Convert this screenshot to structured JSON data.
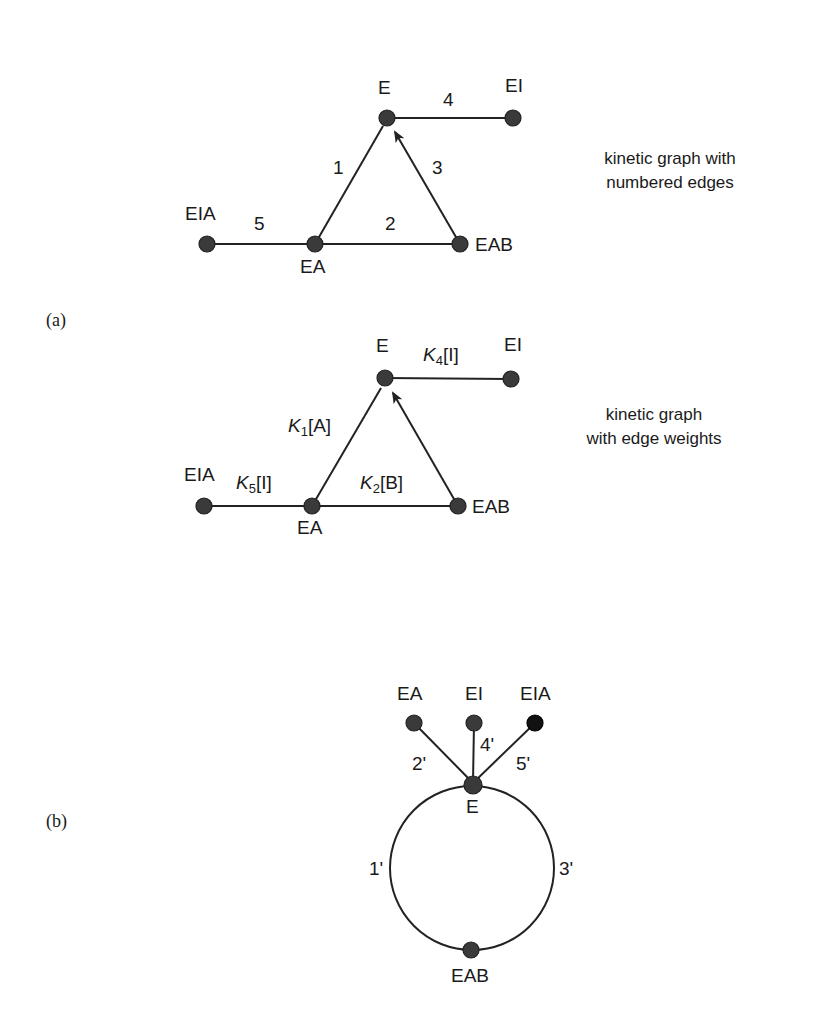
{
  "panel_a": {
    "label": "(a)",
    "graph1": {
      "caption_line1": "kinetic graph with",
      "caption_line2": "numbered edges",
      "nodes": {
        "E": "E",
        "EI": "EI",
        "EIA": "EIA",
        "EA": "EA",
        "EAB": "EAB"
      },
      "edges": {
        "e1": "1",
        "e2": "2",
        "e3": "3",
        "e4": "4",
        "e5": "5"
      }
    },
    "graph2": {
      "caption_line1": "kinetic graph",
      "caption_line2": "with edge weights",
      "nodes": {
        "E": "E",
        "EI": "EI",
        "EIA": "EIA",
        "EA": "EA",
        "EAB": "EAB"
      },
      "edges": {
        "e1": {
          "k": "K",
          "sub": "1",
          "conc": "[A]"
        },
        "e2": {
          "k": "K",
          "sub": "2",
          "conc": "[B]"
        },
        "e4": {
          "k": "K",
          "sub": "4",
          "conc": "[I]"
        },
        "e5": {
          "k": "K",
          "sub": "5",
          "conc": "[I]"
        }
      }
    }
  },
  "panel_b": {
    "label": "(b)",
    "nodes": {
      "EA": "EA",
      "EI": "EI",
      "EIA": "EIA",
      "E": "E",
      "EAB": "EAB"
    },
    "edges": {
      "e1": "1'",
      "e2": "2'",
      "e3": "3'",
      "e4": "4'",
      "e5": "5'"
    }
  }
}
